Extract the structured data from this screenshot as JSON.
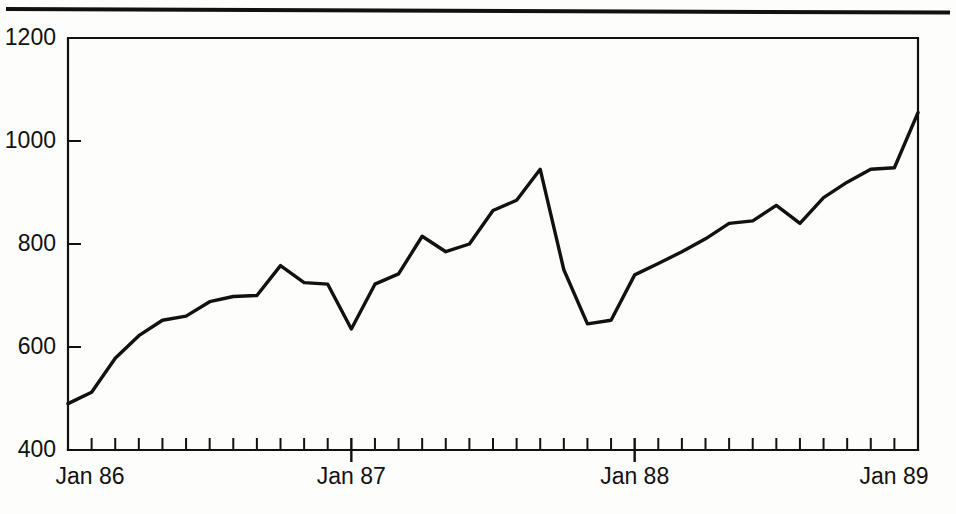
{
  "figure": {
    "background_color": "#fdfdfb",
    "ink_color": "#111111",
    "has_top_rule": true
  },
  "chart_data": {
    "type": "line",
    "title": "",
    "subtitle": "",
    "xlabel": "",
    "ylabel": "",
    "grid": false,
    "legend": null,
    "ylim": [
      400,
      1200
    ],
    "ytick_values": [
      400,
      600,
      800,
      1000,
      1200
    ],
    "ytick_labels": [
      "400",
      "600",
      "800",
      "1000",
      "1200"
    ],
    "xlim": [
      "Jan 86",
      "Jan 89"
    ],
    "xtick_major_labels": [
      "Jan 86",
      "Jan 87",
      "Jan 88",
      "Jan 89"
    ],
    "xtick_minor_interval": "monthly",
    "x": [
      "Jan 86",
      "Feb 86",
      "Mar 86",
      "Apr 86",
      "May 86",
      "Jun 86",
      "Jul 86",
      "Aug 86",
      "Sep 86",
      "Oct 86",
      "Nov 86",
      "Dec 86",
      "Jan 87",
      "Feb 87",
      "Mar 87",
      "Apr 87",
      "May 87",
      "Jun 87",
      "Jul 87",
      "Aug 87",
      "Sep 87",
      "Oct 87",
      "Nov 87",
      "Dec 87",
      "Jan 88",
      "Feb 88",
      "Mar 88",
      "Apr 88",
      "May 88",
      "Jun 88",
      "Jul 88",
      "Aug 88",
      "Sep 88",
      "Oct 88",
      "Nov 88",
      "Dec 88",
      "Jan 89"
    ],
    "values": [
      490,
      512,
      578,
      622,
      652,
      660,
      688,
      698,
      700,
      758,
      725,
      722,
      635,
      722,
      742,
      815,
      785,
      800,
      865,
      885,
      945,
      750,
      645,
      652,
      740,
      762,
      785,
      810,
      840,
      845,
      875,
      840,
      890,
      920,
      945,
      948,
      1055
    ],
    "series": [
      {
        "name": "index",
        "values": [
          490,
          512,
          578,
          622,
          652,
          660,
          688,
          698,
          700,
          758,
          725,
          722,
          635,
          722,
          742,
          815,
          785,
          800,
          865,
          885,
          945,
          750,
          645,
          652,
          740,
          762,
          785,
          810,
          840,
          845,
          875,
          840,
          890,
          920,
          945,
          948,
          1055
        ]
      }
    ],
    "annotations": [
      {
        "label": "peak",
        "x": "Sep 87",
        "y": 945
      },
      {
        "label": "crash-low",
        "x": "Nov 87",
        "y": 645
      },
      {
        "label": "start",
        "x": "Jan 86",
        "y": 490
      },
      {
        "label": "end",
        "x": "Jan 89",
        "y": 1055
      }
    ]
  }
}
